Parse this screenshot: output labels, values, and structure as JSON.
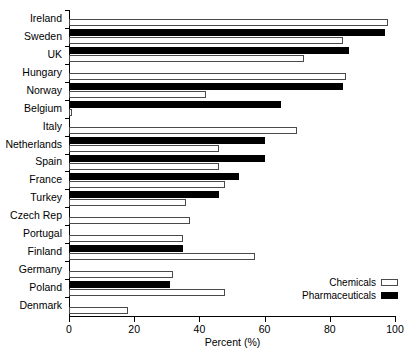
{
  "chart_data": {
    "type": "bar",
    "orientation": "horizontal",
    "title": "",
    "xlabel": "Percent (%)",
    "ylabel": "",
    "xlim": [
      0,
      100
    ],
    "xticks": [
      0,
      20,
      40,
      60,
      80,
      100
    ],
    "grid": false,
    "legend_position": "bottom-right",
    "categories": [
      "Ireland",
      "Sweden",
      "UK",
      "Hungary",
      "Norway",
      "Belgium",
      "Italy",
      "Netherlands",
      "Spain",
      "France",
      "Turkey",
      "Czech Rep",
      "Portugal",
      "Finland",
      "Germany",
      "Poland",
      "Denmark"
    ],
    "series": [
      {
        "name": "Chemicals",
        "color": "#ffffff",
        "values": [
          98,
          84,
          72,
          85,
          42,
          1,
          70,
          46,
          46,
          48,
          36,
          37,
          35,
          57,
          32,
          48,
          18
        ]
      },
      {
        "name": "Pharmaceuticals",
        "color": "#000000",
        "values": [
          0,
          97,
          86,
          0,
          84,
          65,
          0,
          60,
          60,
          52,
          46,
          0,
          0,
          35,
          0,
          31,
          0
        ]
      }
    ]
  },
  "legend": {
    "entries": [
      {
        "label": "Chemicals",
        "swatch": "white"
      },
      {
        "label": "Pharmaceuticals",
        "swatch": "black"
      }
    ]
  },
  "axis": {
    "x_title": "Percent (%)",
    "x_tick_labels": [
      "0",
      "20",
      "40",
      "60",
      "80",
      "100"
    ]
  }
}
